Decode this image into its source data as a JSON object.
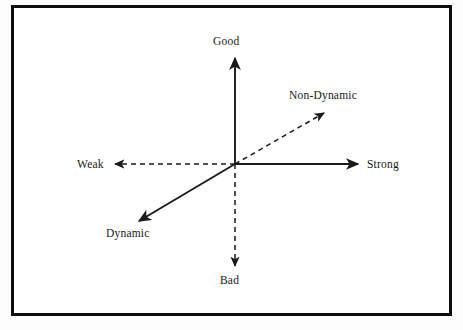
{
  "diagram": {
    "type": "semantic-differential-axes",
    "title": "",
    "origin": {
      "x": 235,
      "y": 164
    },
    "frame_color": "#0d0d0d",
    "line_color": "#1a1a1a",
    "background": "#ffffff",
    "axes": [
      {
        "id": "good",
        "label": "Good",
        "direction": "up",
        "style": "solid",
        "arrowhead": true,
        "from": {
          "x": 235,
          "y": 164
        },
        "to": {
          "x": 235,
          "y": 56
        }
      },
      {
        "id": "bad",
        "label": "Bad",
        "direction": "down",
        "style": "dashed",
        "arrowhead": true,
        "from": {
          "x": 235,
          "y": 164
        },
        "to": {
          "x": 235,
          "y": 268
        }
      },
      {
        "id": "strong",
        "label": "Strong",
        "direction": "right",
        "style": "solid",
        "arrowhead": true,
        "from": {
          "x": 235,
          "y": 164
        },
        "to": {
          "x": 360,
          "y": 164
        }
      },
      {
        "id": "weak",
        "label": "Weak",
        "direction": "left",
        "style": "dashed",
        "arrowhead": true,
        "from": {
          "x": 235,
          "y": 164
        },
        "to": {
          "x": 113,
          "y": 164
        }
      },
      {
        "id": "non-dynamic",
        "label": "Non-Dynamic",
        "direction": "up-right",
        "style": "dashed",
        "arrowhead": true,
        "from": {
          "x": 235,
          "y": 164
        },
        "to": {
          "x": 326,
          "y": 112
        }
      },
      {
        "id": "dynamic",
        "label": "Dynamic",
        "direction": "down-left",
        "style": "solid",
        "arrowhead": true,
        "from": {
          "x": 235,
          "y": 164
        },
        "to": {
          "x": 137,
          "y": 222
        }
      }
    ]
  }
}
